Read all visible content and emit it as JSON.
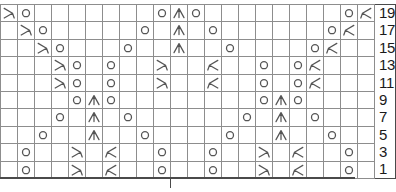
{
  "chart": {
    "columns": 22,
    "rows": 10,
    "row_labels": [
      "19",
      "17",
      "15",
      "13",
      "11",
      "9",
      "7",
      "5",
      "3",
      "1"
    ],
    "symbol_legend": {
      "empty": "knit (blank square)",
      "O": "yarn over",
      "L": "ssk / left-leaning decrease",
      "R": "k2tog / right-leaning decrease",
      "A": "central double decrease"
    },
    "colors": {
      "grid_line": "#8d8d8d",
      "border": "#4a4a4a",
      "symbol": "#555555",
      "label_text": "#1a1a1a",
      "background": "#ffffff"
    },
    "center_marker": {
      "visible": true,
      "position_column": 11
    },
    "cells": [
      [
        "L",
        "O",
        "",
        "",
        "",
        "",
        "",
        "",
        "",
        "O",
        "A",
        "O",
        "",
        "",
        "",
        "",
        "",
        "",
        "",
        "",
        "O",
        "R"
      ],
      [
        "",
        "L",
        "O",
        "",
        "",
        "",
        "",
        "",
        "O",
        "",
        "A",
        "",
        "O",
        "",
        "",
        "",
        "",
        "",
        "",
        "O",
        "R",
        ""
      ],
      [
        "",
        "",
        "L",
        "O",
        "",
        "",
        "",
        "O",
        "",
        "",
        "A",
        "",
        "",
        "O",
        "",
        "",
        "",
        "",
        "O",
        "R",
        "",
        ""
      ],
      [
        "",
        "",
        "",
        "L",
        "O",
        "",
        "O",
        "",
        "",
        "L",
        "",
        "",
        "R",
        "",
        "",
        "O",
        "",
        "O",
        "R",
        "",
        "",
        ""
      ],
      [
        "",
        "",
        "",
        "L",
        "O",
        "",
        "O",
        "",
        "",
        "L",
        "",
        "",
        "R",
        "",
        "",
        "O",
        "",
        "O",
        "R",
        "",
        "",
        ""
      ],
      [
        "",
        "",
        "",
        "",
        "O",
        "A",
        "O",
        "",
        "",
        "",
        "",
        "",
        "",
        "",
        "",
        "O",
        "A",
        "O",
        "",
        "",
        "",
        ""
      ],
      [
        "",
        "",
        "",
        "O",
        "",
        "A",
        "",
        "O",
        "",
        "",
        "",
        "",
        "",
        "",
        "O",
        "",
        "A",
        "",
        "O",
        "",
        "",
        ""
      ],
      [
        "",
        "",
        "O",
        "",
        "",
        "A",
        "",
        "",
        "O",
        "",
        "",
        "",
        "",
        "O",
        "",
        "",
        "A",
        "",
        "",
        "O",
        "",
        ""
      ],
      [
        "",
        "O",
        "",
        "",
        "L",
        "",
        "R",
        "",
        "",
        "O",
        "",
        "",
        "O",
        "",
        "",
        "L",
        "",
        "R",
        "",
        "",
        "O",
        ""
      ],
      [
        "",
        "O",
        "",
        "",
        "L",
        "",
        "R",
        "",
        "",
        "O",
        "",
        "",
        "O",
        "",
        "",
        "L",
        "",
        "R",
        "",
        "",
        "O",
        ""
      ]
    ]
  }
}
